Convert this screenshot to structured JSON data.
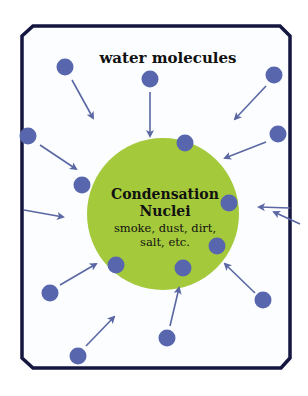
{
  "title": "water molecules",
  "nucleus": {
    "title_line1": "Condensation",
    "title_line2": "Nuclei",
    "sub_line1": "smoke, dust, dirt,",
    "sub_line2": "salt, etc.",
    "color": "#a4c93b"
  },
  "colors": {
    "frame": "#14163f",
    "molecule": "#5866ad",
    "arrow": "#5a67a3",
    "background": "#fbfdff"
  },
  "molecules": [
    {
      "x": 65,
      "y": 67
    },
    {
      "x": 150,
      "y": 79
    },
    {
      "x": 274,
      "y": 75
    },
    {
      "x": 28,
      "y": 136
    },
    {
      "x": 278,
      "y": 134
    },
    {
      "x": 185,
      "y": 143
    },
    {
      "x": 82,
      "y": 185
    },
    {
      "x": 229,
      "y": 203
    },
    {
      "x": 217,
      "y": 246
    },
    {
      "x": 116,
      "y": 265
    },
    {
      "x": 183,
      "y": 268
    },
    {
      "x": 50,
      "y": 293
    },
    {
      "x": 263,
      "y": 300
    },
    {
      "x": 167,
      "y": 338
    },
    {
      "x": 78,
      "y": 356
    }
  ],
  "arrows": [
    {
      "x1": 72,
      "y1": 80,
      "x2": 93,
      "y2": 118
    },
    {
      "x1": 150,
      "y1": 92,
      "x2": 150,
      "y2": 136
    },
    {
      "x1": 266,
      "y1": 86,
      "x2": 235,
      "y2": 119
    },
    {
      "x1": 40,
      "y1": 145,
      "x2": 76,
      "y2": 169
    },
    {
      "x1": 266,
      "y1": 142,
      "x2": 225,
      "y2": 158
    },
    {
      "x1": 24,
      "y1": 210,
      "x2": 63,
      "y2": 217
    },
    {
      "x1": 290,
      "y1": 208,
      "x2": 259,
      "y2": 207
    },
    {
      "x1": 300,
      "y1": 224,
      "x2": 274,
      "y2": 212
    },
    {
      "x1": 60,
      "y1": 285,
      "x2": 96,
      "y2": 264
    },
    {
      "x1": 255,
      "y1": 293,
      "x2": 225,
      "y2": 264
    },
    {
      "x1": 170,
      "y1": 326,
      "x2": 179,
      "y2": 288
    },
    {
      "x1": 86,
      "y1": 346,
      "x2": 114,
      "y2": 317
    }
  ]
}
